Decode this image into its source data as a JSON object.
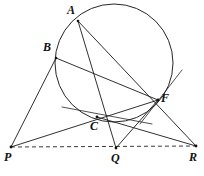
{
  "figure": {
    "width": 204,
    "height": 176,
    "background_color": "#ffffff",
    "stroke_color": "#1a1a1a"
  },
  "points": {
    "A": {
      "label": "A",
      "x": 78,
      "y": 21,
      "label_x": 67,
      "label_y": 4,
      "on_circle": true
    },
    "B": {
      "label": "B",
      "x": 56,
      "y": 58,
      "label_x": 43,
      "label_y": 41,
      "on_circle": true
    },
    "C": {
      "label": "C",
      "x": 97,
      "y": 117,
      "label_x": 90,
      "label_y": 120,
      "on_circle": true
    },
    "F": {
      "label": "F",
      "x": 158,
      "y": 100,
      "label_x": 161,
      "label_y": 92,
      "on_circle": true
    },
    "P": {
      "label": "P",
      "x": 11,
      "y": 147,
      "label_x": 4,
      "label_y": 151,
      "on_circle": false
    },
    "Q": {
      "label": "Q",
      "x": 116,
      "y": 148,
      "label_x": 111,
      "label_y": 152,
      "on_circle": false
    },
    "R": {
      "label": "R",
      "x": 196,
      "y": 146,
      "label_x": 189,
      "label_y": 151,
      "on_circle": false
    }
  },
  "circle": {
    "name": "circumcircle-ABCF",
    "center_x": 114,
    "center_y": 63,
    "radius": 59,
    "style": "solid"
  },
  "segments": [
    {
      "name": "segment-A-R",
      "from": "A",
      "to": "R",
      "style": "solid",
      "through": "F"
    },
    {
      "name": "segment-A-Q",
      "from": "A",
      "to": "Q",
      "style": "solid",
      "through": "C"
    },
    {
      "name": "segment-B-P",
      "from": "B",
      "to": "P",
      "style": "solid",
      "through": ""
    },
    {
      "name": "segment-B-F",
      "from": "B",
      "to": "F",
      "style": "solid",
      "through": "C"
    },
    {
      "name": "segment-P-F",
      "from": "P",
      "to": "F",
      "style": "solid",
      "through": ""
    },
    {
      "name": "segment-C-R",
      "from": "C",
      "to": "R",
      "style": "solid",
      "through": ""
    },
    {
      "name": "segment-Q-F",
      "from": "Q",
      "to": "F",
      "style": "solid",
      "through": ""
    },
    {
      "name": "segment-P-R-baseline",
      "from": "P",
      "to": "R",
      "style": "dashed",
      "through": "Q"
    }
  ],
  "tangents": [
    {
      "name": "tangent-at-C",
      "at": "C",
      "x1": 62,
      "y1": 107,
      "x2": 152,
      "y2": 124
    },
    {
      "name": "tangent-at-F",
      "at": "F",
      "x1": 140,
      "y1": 124,
      "x2": 182,
      "y2": 70
    }
  ],
  "labels_order": [
    "A",
    "B",
    "F",
    "C",
    "P",
    "Q",
    "R"
  ]
}
